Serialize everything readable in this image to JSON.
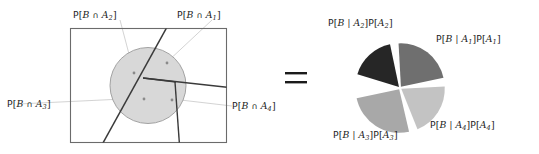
{
  "figure": {
    "type": "probability-partition-diagram",
    "equals_sign": "=",
    "left_panel": {
      "name": "sample-space-rectangle-with-event-B",
      "outer_shape": "rectangle",
      "event_shape": "circle",
      "event_label": "B",
      "partition_count": 4,
      "labels": [
        {
          "id": "A2",
          "text": "P[B ∩ A2]",
          "position": "top-left"
        },
        {
          "id": "A1",
          "text": "P[B ∩ A1]",
          "position": "top-right"
        },
        {
          "id": "A3",
          "text": "P[B ∩ A3]",
          "position": "bottom-left"
        },
        {
          "id": "A4",
          "text": "P[B ∩ A4]",
          "position": "bottom-right"
        }
      ]
    },
    "right_panel": {
      "name": "pie-chart-of-joint-probabilities",
      "labels": [
        {
          "id": "A2",
          "text": "P[B | A2]P[A2]",
          "position": "top-left"
        },
        {
          "id": "A1",
          "text": "P[B | A1]P[A1]",
          "position": "top-right"
        },
        {
          "id": "A3",
          "text": "P[B | A3]P[A3]",
          "position": "bottom-left"
        },
        {
          "id": "A4",
          "text": "P[B | A4]P[A4]",
          "position": "bottom-right"
        }
      ]
    }
  },
  "chart_data": {
    "type": "pie",
    "title": "",
    "categories": [
      "P[B | A2]P[A2]",
      "P[B | A1]P[A1]",
      "P[B | A4]P[A4]",
      "P[B | A3]P[A3]"
    ],
    "slice_ids": [
      "A2",
      "A1",
      "A4",
      "A3"
    ],
    "values": [
      18,
      24,
      21,
      27
    ],
    "units": "percent of circle area",
    "start_angles_deg": [
      100,
      10,
      -70,
      190
    ],
    "end_angles_deg": [
      165,
      95,
      5,
      285
    ],
    "colors": [
      "#262626",
      "#6f6f6f",
      "#c3c3c3",
      "#a8a8a8"
    ],
    "gap_white_px": 2.6,
    "legend": "none",
    "labels_position": "outside",
    "grid": false
  },
  "colors": {
    "circle_fill": "#d8d8d8",
    "circle_stroke": "#8e8e8e",
    "rect_stroke": "#6b6b6b",
    "partition_stroke": "#3a3a3a",
    "leader_stroke": "#bdbdbd",
    "dot_fill": "#8a8a8a",
    "text": "#1b1b1b",
    "pie_a2": "#262626",
    "pie_a1": "#6f6f6f",
    "pie_a4": "#c3c3c3",
    "pie_a3": "#a8a8a8"
  }
}
